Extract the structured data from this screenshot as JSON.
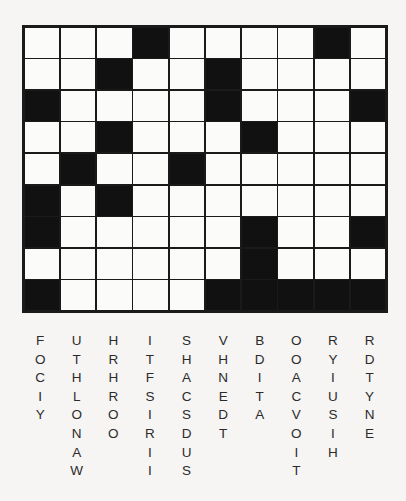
{
  "puzzle": {
    "type": "word-fit-crossword",
    "background_color": "#f6f5f3",
    "grid": {
      "rows": 9,
      "columns": 10,
      "cell_fill_color": "#fbfbfa",
      "block_fill_color": "#111111",
      "border_color": "#1a1a1a",
      "legend": {
        "0": "open-cell",
        "1": "block-cell"
      },
      "matrix": [
        [
          0,
          0,
          0,
          1,
          0,
          0,
          0,
          0,
          1,
          0
        ],
        [
          0,
          0,
          1,
          0,
          0,
          1,
          0,
          0,
          0,
          0
        ],
        [
          1,
          0,
          0,
          0,
          0,
          1,
          0,
          0,
          0,
          1
        ],
        [
          0,
          0,
          1,
          0,
          0,
          0,
          1,
          0,
          0,
          0
        ],
        [
          0,
          1,
          0,
          0,
          1,
          0,
          0,
          0,
          0,
          0
        ],
        [
          1,
          0,
          1,
          0,
          0,
          0,
          0,
          0,
          0,
          0
        ],
        [
          1,
          0,
          0,
          0,
          0,
          0,
          1,
          0,
          0,
          1
        ],
        [
          0,
          0,
          0,
          0,
          0,
          0,
          1,
          0,
          0,
          0
        ],
        [
          1,
          0,
          0,
          0,
          0,
          1,
          1,
          1,
          1,
          1
        ]
      ]
    },
    "letter_bank": {
      "text_color": "#2b2b2b",
      "columns": [
        {
          "index": 1,
          "word": "FOCIY",
          "letters": [
            "F",
            "O",
            "C",
            "I",
            "Y"
          ]
        },
        {
          "index": 2,
          "word": "UTHLONAW",
          "letters": [
            "U",
            "T",
            "H",
            "L",
            "O",
            "N",
            "A",
            "W"
          ]
        },
        {
          "index": 3,
          "word": "HRHROO",
          "letters": [
            "H",
            "R",
            "H",
            "R",
            "O",
            "O"
          ]
        },
        {
          "index": 4,
          "word": "ITFSIRII",
          "letters": [
            "I",
            "T",
            "F",
            "S",
            "I",
            "R",
            "I",
            "I"
          ]
        },
        {
          "index": 5,
          "word": "SHACSDUS",
          "letters": [
            "S",
            "H",
            "A",
            "C",
            "S",
            "D",
            "U",
            "S"
          ]
        },
        {
          "index": 6,
          "word": "VHNEDT",
          "letters": [
            "V",
            "H",
            "N",
            "E",
            "D",
            "T"
          ]
        },
        {
          "index": 7,
          "word": "BDITA",
          "letters": [
            "B",
            "D",
            "I",
            "T",
            "A"
          ]
        },
        {
          "index": 8,
          "word": "OOACVOIT",
          "letters": [
            "O",
            "O",
            "A",
            "C",
            "V",
            "O",
            "I",
            "T"
          ]
        },
        {
          "index": 9,
          "word": "RYIUSIH",
          "letters": [
            "R",
            "Y",
            "I",
            "U",
            "S",
            "I",
            "H"
          ]
        },
        {
          "index": 10,
          "word": "RDTYNE",
          "letters": [
            "R",
            "D",
            "T",
            "Y",
            "N",
            "E"
          ]
        }
      ]
    }
  }
}
